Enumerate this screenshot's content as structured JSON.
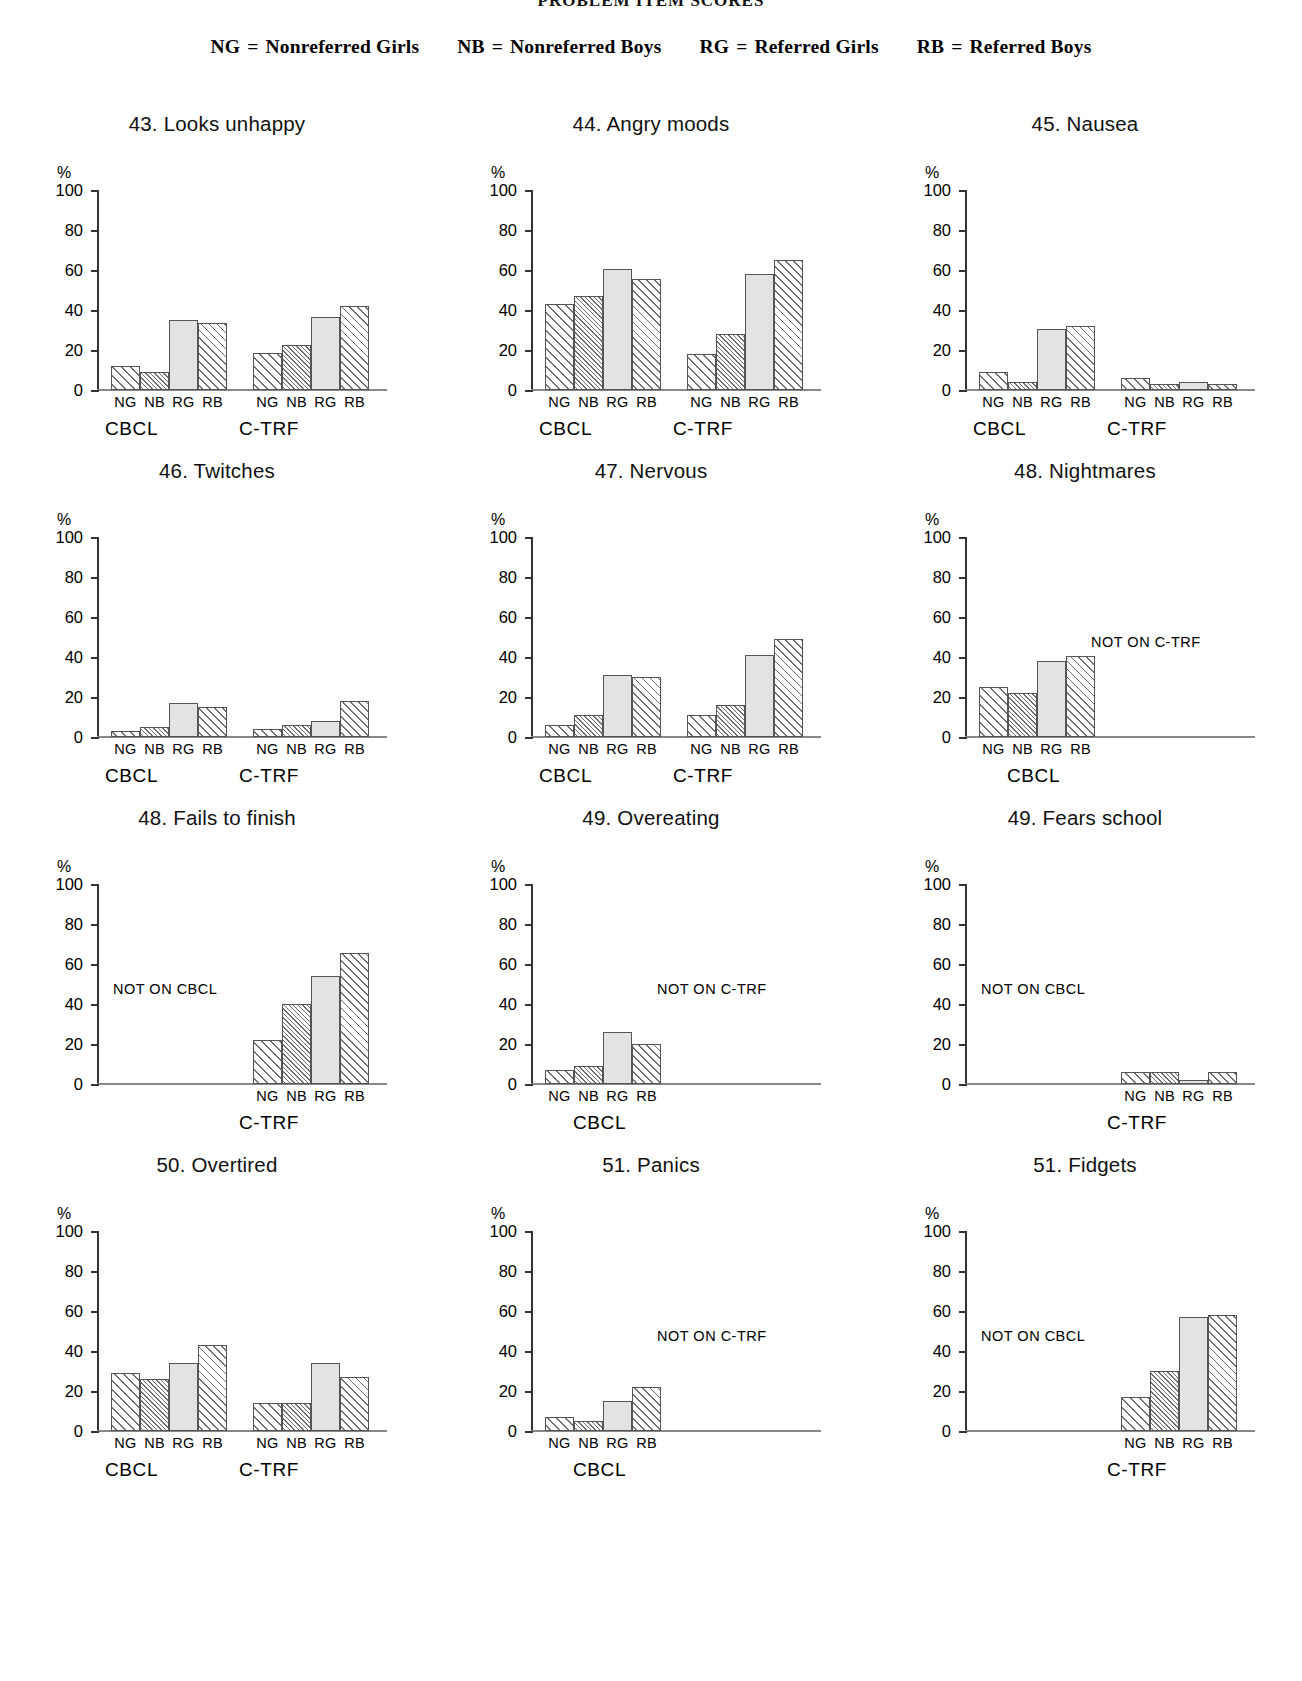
{
  "page_header": "PROBLEM ITEM SCORES",
  "legend": [
    {
      "abbr": "NG",
      "eq": "=",
      "label": "Nonreferred Girls"
    },
    {
      "abbr": "NB",
      "eq": "=",
      "label": "Nonreferred Boys"
    },
    {
      "abbr": "RG",
      "eq": "=",
      "label": "Referred Girls"
    },
    {
      "abbr": "RB",
      "eq": "=",
      "label": "Referred Boys"
    }
  ],
  "axis": {
    "unit": "%",
    "ticks": [
      "100",
      "80",
      "60",
      "40",
      "20",
      "0"
    ],
    "categories": [
      "NG",
      "NB",
      "RG",
      "RB"
    ],
    "panels": {
      "cbcl": "CBCL",
      "ctrf": "C-TRF"
    },
    "not_on_cbcl": "NOT ON CBCL",
    "not_on_ctrf": "NOT ON C-TRF"
  },
  "chart_data": [
    {
      "type": "bar",
      "title": "43. Looks unhappy",
      "ylabel": "%",
      "ylim": [
        0,
        100
      ],
      "categories": [
        "NG",
        "NB",
        "RG",
        "RB"
      ],
      "series": [
        {
          "name": "CBCL",
          "values": [
            12,
            9,
            35,
            33.5
          ]
        },
        {
          "name": "C-TRF",
          "values": [
            18.5,
            22.5,
            36.5,
            42
          ]
        }
      ]
    },
    {
      "type": "bar",
      "title": "44. Angry moods",
      "ylabel": "%",
      "ylim": [
        0,
        100
      ],
      "categories": [
        "NG",
        "NB",
        "RG",
        "RB"
      ],
      "series": [
        {
          "name": "CBCL",
          "values": [
            43,
            47,
            60.5,
            55.5
          ]
        },
        {
          "name": "C-TRF",
          "values": [
            18,
            28,
            58,
            65
          ]
        }
      ]
    },
    {
      "type": "bar",
      "title": "45. Nausea",
      "ylabel": "%",
      "ylim": [
        0,
        100
      ],
      "categories": [
        "NG",
        "NB",
        "RG",
        "RB"
      ],
      "series": [
        {
          "name": "CBCL",
          "values": [
            9,
            4,
            30.5,
            32
          ]
        },
        {
          "name": "C-TRF",
          "values": [
            6,
            3,
            4,
            3
          ]
        }
      ]
    },
    {
      "type": "bar",
      "title": "46. Twitches",
      "ylabel": "%",
      "ylim": [
        0,
        100
      ],
      "categories": [
        "NG",
        "NB",
        "RG",
        "RB"
      ],
      "series": [
        {
          "name": "CBCL",
          "values": [
            3,
            5,
            17,
            15
          ]
        },
        {
          "name": "C-TRF",
          "values": [
            4,
            6,
            8,
            18
          ]
        }
      ]
    },
    {
      "type": "bar",
      "title": "47. Nervous",
      "ylabel": "%",
      "ylim": [
        0,
        100
      ],
      "categories": [
        "NG",
        "NB",
        "RG",
        "RB"
      ],
      "series": [
        {
          "name": "CBCL",
          "values": [
            6,
            11,
            31,
            30
          ]
        },
        {
          "name": "C-TRF",
          "values": [
            11,
            16,
            41,
            49
          ]
        }
      ]
    },
    {
      "type": "bar",
      "title": "48. Nightmares",
      "ylabel": "%",
      "ylim": [
        0,
        100
      ],
      "categories": [
        "NG",
        "NB",
        "RG",
        "RB"
      ],
      "note": "NOT ON C-TRF",
      "series": [
        {
          "name": "CBCL",
          "values": [
            25,
            22,
            38,
            40.5
          ]
        },
        {
          "name": "C-TRF",
          "values": null
        }
      ]
    },
    {
      "type": "bar",
      "title": "48. Fails to finish",
      "ylabel": "%",
      "ylim": [
        0,
        100
      ],
      "categories": [
        "NG",
        "NB",
        "RG",
        "RB"
      ],
      "note": "NOT ON CBCL",
      "series": [
        {
          "name": "CBCL",
          "values": null
        },
        {
          "name": "C-TRF",
          "values": [
            22,
            40,
            54,
            65.5
          ]
        }
      ]
    },
    {
      "type": "bar",
      "title": "49. Overeating",
      "ylabel": "%",
      "ylim": [
        0,
        100
      ],
      "categories": [
        "NG",
        "NB",
        "RG",
        "RB"
      ],
      "note": "NOT ON C-TRF",
      "series": [
        {
          "name": "CBCL",
          "values": [
            7,
            9,
            26,
            20
          ]
        },
        {
          "name": "C-TRF",
          "values": null
        }
      ]
    },
    {
      "type": "bar",
      "title": "49. Fears school",
      "ylabel": "%",
      "ylim": [
        0,
        100
      ],
      "categories": [
        "NG",
        "NB",
        "RG",
        "RB"
      ],
      "note": "NOT ON CBCL",
      "series": [
        {
          "name": "CBCL",
          "values": null
        },
        {
          "name": "C-TRF",
          "values": [
            6,
            6,
            2,
            6
          ]
        }
      ]
    },
    {
      "type": "bar",
      "title": "50. Overtired",
      "ylabel": "%",
      "ylim": [
        0,
        100
      ],
      "categories": [
        "NG",
        "NB",
        "RG",
        "RB"
      ],
      "series": [
        {
          "name": "CBCL",
          "values": [
            29,
            26,
            34,
            43
          ]
        },
        {
          "name": "C-TRF",
          "values": [
            14,
            14,
            34,
            27
          ]
        }
      ]
    },
    {
      "type": "bar",
      "title": "51. Panics",
      "ylabel": "%",
      "ylim": [
        0,
        100
      ],
      "categories": [
        "NG",
        "NB",
        "RG",
        "RB"
      ],
      "note": "NOT ON C-TRF",
      "series": [
        {
          "name": "CBCL",
          "values": [
            7,
            5,
            15,
            22
          ]
        },
        {
          "name": "C-TRF",
          "values": null
        }
      ]
    },
    {
      "type": "bar",
      "title": "51. Fidgets",
      "ylabel": "%",
      "ylim": [
        0,
        100
      ],
      "categories": [
        "NG",
        "NB",
        "RG",
        "RB"
      ],
      "note": "NOT ON CBCL",
      "series": [
        {
          "name": "CBCL",
          "values": null
        },
        {
          "name": "C-TRF",
          "values": [
            17,
            30,
            57,
            58
          ]
        }
      ]
    }
  ]
}
